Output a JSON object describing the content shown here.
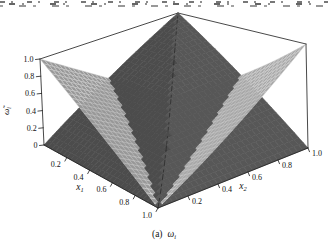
{
  "figure": {
    "caption": {
      "index": "(a)",
      "symbol_base": "ω",
      "symbol_sub": "i"
    },
    "axes": {
      "x1": {
        "label_base": "x",
        "label_sub": "1"
      },
      "x2": {
        "label_base": "x",
        "label_sub": "2"
      },
      "z": {
        "label_base": "ω̃",
        "label_sub": "i"
      }
    }
  },
  "chart_data": {
    "type": "surface",
    "title": "",
    "xlabel": "x1",
    "ylabel": "x2",
    "zlabel": "ω̃i",
    "axes": {
      "x1": {
        "range": [
          0,
          1
        ],
        "ticks": [
          {
            "v": 0.2,
            "label": "0.2"
          },
          {
            "v": 0.4,
            "label": "0.4"
          },
          {
            "v": 0.6,
            "label": "0.6"
          },
          {
            "v": 0.8,
            "label": "0.8"
          },
          {
            "v": 1.0,
            "label": "1.0"
          }
        ]
      },
      "x2": {
        "range": [
          0,
          1
        ],
        "ticks": [
          {
            "v": 0.2,
            "label": "0.2"
          },
          {
            "v": 0.4,
            "label": "0.4"
          },
          {
            "v": 0.6,
            "label": "0.6"
          },
          {
            "v": 0.8,
            "label": "0.8"
          },
          {
            "v": 1.0,
            "label": "1.0"
          }
        ]
      },
      "z": {
        "range": [
          0,
          1
        ],
        "ticks": [
          {
            "v": 0,
            "label": "0"
          },
          {
            "v": 0.2,
            "label": "0.2"
          },
          {
            "v": 0.4,
            "label": "0.4"
          },
          {
            "v": 0.6,
            "label": "0.6"
          },
          {
            "v": 0.8,
            "label": "0.8"
          },
          {
            "v": 1.0,
            "label": "1.0"
          }
        ]
      }
    },
    "surfaces": [
      {
        "name": "dark-pyramid-surface",
        "formula": "min(1 - x1, x2)",
        "corner_values": {
          "x1_0_x2_0": 0,
          "x1_1_x2_0": 0,
          "x1_1_x2_1": 0,
          "x1_0_x2_1": 1,
          "center": 0.5
        },
        "mesh": false,
        "color": "#4c4c4c",
        "color2": "#575757",
        "ridge_color": "#2e2e2e"
      },
      {
        "name": "light-valley-mesh-surface",
        "formula": "abs(x1 + x2 - 1)",
        "corner_values": {
          "x1_0_x2_0": 1,
          "x1_1_x2_0": 0,
          "x1_1_x2_1": 1,
          "x1_0_x2_1": 0,
          "center": 0
        },
        "mesh": true,
        "color": "#989898",
        "color2": "#a7a7a7",
        "mesh_color": "#d3d3d3",
        "mesh_highlight": "#efefef"
      }
    ],
    "view": {
      "grid_n": 30,
      "edge_color": "#1a1a1a",
      "tick_font_px": 8,
      "corners": {
        "c000": [
          44,
          145
        ],
        "c100": [
          158,
          208
        ],
        "c110": [
          308,
          148
        ],
        "c010": [
          172,
          96
        ],
        "c001": [
          40,
          59
        ],
        "c101": [
          158,
          121
        ],
        "c111": [
          306,
          44
        ],
        "c011": [
          178,
          13
        ]
      }
    }
  }
}
